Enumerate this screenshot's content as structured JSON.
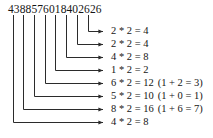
{
  "figure": {
    "type": "luhn-doubling-diagram",
    "width": 213,
    "height": 138,
    "background_color": "#ffffff",
    "line_color": "#2b2b2b",
    "text_color": "#151515"
  },
  "number": {
    "label": "4388576018402626",
    "digit_count": 16
  },
  "steps": [
    {
      "index": 0,
      "digit": "2",
      "equation": "2 * 2 = 4",
      "note": ""
    },
    {
      "index": 1,
      "digit": "2",
      "equation": "2 * 2 = 4",
      "note": ""
    },
    {
      "index": 2,
      "digit": "4",
      "equation": "4 * 2 = 8",
      "note": ""
    },
    {
      "index": 3,
      "digit": "1",
      "equation": "1 * 2 = 2",
      "note": ""
    },
    {
      "index": 4,
      "digit": "6",
      "equation": "6 * 2 = 12",
      "note": "(1 + 2 = 3)"
    },
    {
      "index": 5,
      "digit": "5",
      "equation": "5 * 2 = 10",
      "note": "(1 + 0 = 1)"
    },
    {
      "index": 6,
      "digit": "8",
      "equation": "8 * 2 = 16",
      "note": "(1 + 6 = 7)"
    },
    {
      "index": 7,
      "digit": "4",
      "equation": "4 * 2 = 8",
      "note": ""
    }
  ],
  "connectors": [
    {
      "index": 0,
      "tick_x": 88,
      "arrow_y": 31
    },
    {
      "index": 1,
      "tick_x": 77,
      "arrow_y": 44
    },
    {
      "index": 2,
      "tick_x": 66,
      "arrow_y": 57
    },
    {
      "index": 3,
      "tick_x": 55,
      "arrow_y": 70
    },
    {
      "index": 4,
      "tick_x": 45,
      "arrow_y": 83
    },
    {
      "index": 5,
      "tick_x": 34,
      "arrow_y": 96
    },
    {
      "index": 6,
      "tick_x": 23,
      "arrow_y": 109
    },
    {
      "index": 7,
      "tick_x": 13,
      "arrow_y": 122
    }
  ]
}
